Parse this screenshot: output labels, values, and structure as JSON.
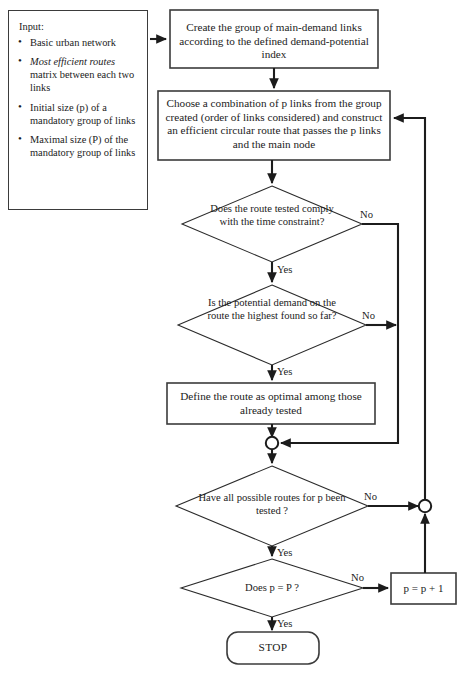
{
  "diagram": {
    "input_panel": {
      "heading": "Input:",
      "items": [
        {
          "text_plain": "Basic urban network",
          "italic_part": "",
          "rest": "Basic urban network"
        },
        {
          "text_plain": "Most efficient routes matrix between each two links",
          "italic_part": "Most efficient routes",
          "rest": " matrix between each two links"
        },
        {
          "text_plain": "Initial size (p) of a mandatory group of links",
          "italic_part": "",
          "rest": "Initial size (p) of a mandatory group of links"
        },
        {
          "text_plain": "Maximal size (P) of the mandatory group of links",
          "italic_part": "",
          "rest": "Maximal size (P) of the mandatory group of links"
        }
      ]
    },
    "nodes": {
      "create_group": {
        "type": "process",
        "text": "Create the group of main-demand links according to the defined demand-potential index"
      },
      "choose_combination": {
        "type": "process",
        "text": "Choose a combination of p links from the group created (order of links considered) and construct an efficient circular route that passes the p links and the main node"
      },
      "time_constraint": {
        "type": "decision",
        "text": "Does the route tested comply with the time constraint?"
      },
      "potential_demand": {
        "type": "decision",
        "text": "Is the potential demand on the route the highest found so far?"
      },
      "define_optimal": {
        "type": "process",
        "text": "Define the route as optimal among those already tested"
      },
      "all_routes_tested": {
        "type": "decision",
        "text": "Have all possible routes for p been tested ?"
      },
      "p_equals_P": {
        "type": "decision",
        "text": "Does p = P ?"
      },
      "increment_p": {
        "type": "process",
        "text": "p = p + 1"
      },
      "stop": {
        "type": "terminator",
        "text": "STOP"
      }
    },
    "edge_labels": {
      "no_time": "No",
      "yes_time": "Yes",
      "no_demand": "No",
      "yes_demand": "Yes",
      "no_all_routes": "No",
      "yes_all_routes": "Yes",
      "no_p_equals": "No",
      "yes_p_equals": "Yes"
    },
    "colors": {
      "stroke": "#3b3b3b",
      "connector": "#1c1c1c",
      "fill": "#ffffff",
      "text": "#1b1b1b"
    }
  }
}
